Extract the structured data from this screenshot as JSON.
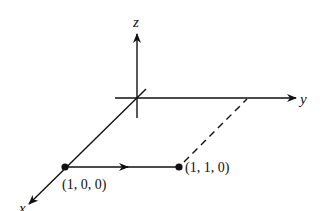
{
  "diagram": {
    "type": "3d-coordinate-axes",
    "axes": {
      "x": {
        "label": "x"
      },
      "y": {
        "label": "y"
      },
      "z": {
        "label": "z"
      }
    },
    "points": [
      {
        "label": "(1, 0, 0)"
      },
      {
        "label": "(1, 1, 0)"
      }
    ],
    "segments": [
      {
        "from": "(1, 0, 0)",
        "to": "(1, 1, 0)",
        "style": "solid-with-direction-arrow"
      },
      {
        "from": "(1, 1, 0)",
        "to": "y-axis (0, 1, 0)",
        "style": "dashed"
      }
    ],
    "colors": {
      "ink": "#111111",
      "background": "#ffffff"
    }
  }
}
